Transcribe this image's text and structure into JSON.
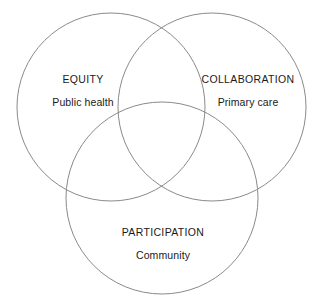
{
  "diagram": {
    "type": "venn",
    "set_count": 3,
    "background_color": "#ffffff",
    "stroke_color": "#8a8a8a",
    "text_color": "#1a1a1a",
    "sets": [
      {
        "id": "equity",
        "title": "EQUITY",
        "subtitle": "Public health",
        "position": "left",
        "center_x": 111,
        "center_y": 107,
        "radius": 94
      },
      {
        "id": "collaboration",
        "title": "COLLABORATION",
        "subtitle": "Primary care",
        "position": "right",
        "center_x": 212,
        "center_y": 107,
        "radius": 94
      },
      {
        "id": "participation",
        "title": "PARTICIPATION",
        "subtitle": "Community",
        "position": "bottom",
        "center_x": 162,
        "center_y": 198,
        "radius": 96
      }
    ]
  }
}
